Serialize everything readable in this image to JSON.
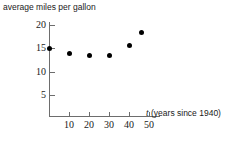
{
  "chart_data": {
    "type": "scatter",
    "title": "average miles per gallon",
    "xlabel": "t (years since 1940)",
    "ylabel": "average miles per gallon",
    "x_axis_variable": "t",
    "x_axis_note": "(years since 1940)",
    "xlim": [
      0,
      55
    ],
    "ylim": [
      0,
      21
    ],
    "xticks": [
      10,
      20,
      30,
      40,
      50
    ],
    "yticks": [
      5,
      10,
      15,
      20
    ],
    "grid": false,
    "legend": null,
    "points": [
      {
        "x": 0,
        "y": 15.0
      },
      {
        "x": 10,
        "y": 14.0
      },
      {
        "x": 20,
        "y": 13.5
      },
      {
        "x": 30,
        "y": 13.5
      },
      {
        "x": 40,
        "y": 15.7
      },
      {
        "x": 46,
        "y": 18.3
      }
    ],
    "x": [
      0,
      10,
      20,
      30,
      40,
      46
    ],
    "values": [
      15.0,
      14.0,
      13.5,
      13.5,
      15.7,
      18.3
    ],
    "marker": "filled-circle",
    "marker_color": "#000000",
    "axis_color": "#6d6d6d"
  },
  "axis": {
    "y_tick_labels": [
      "20",
      "15",
      "10",
      "5"
    ],
    "x_tick_labels": [
      "10",
      "20",
      "30",
      "40",
      "50"
    ]
  }
}
